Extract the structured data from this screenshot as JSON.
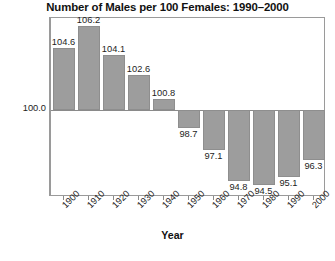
{
  "chart_data": {
    "type": "bar",
    "title": "Number of Males per 100 Females: 1990–2000",
    "xlabel": "Year",
    "ylabel": "",
    "categories": [
      "1900",
      "1910",
      "1920",
      "1930",
      "1940",
      "1950",
      "1960",
      "1970",
      "1980",
      "1990",
      "2000"
    ],
    "values": [
      104.6,
      106.2,
      104.1,
      102.6,
      100.8,
      98.7,
      97.1,
      94.8,
      94.5,
      95.1,
      96.3
    ],
    "value_labels": [
      "104.6",
      "106.2",
      "104.1",
      "102.6",
      "100.8",
      "98.7",
      "97.1",
      "94.8",
      "94.5",
      "95.1",
      "96.3"
    ],
    "baseline": 100.0,
    "baseline_label": "100.0",
    "y_tick_labels": [
      "100.0"
    ],
    "ylim": [
      93.6,
      106.8
    ],
    "grid": false,
    "legend": "none",
    "bar_color": "#9d9d9d",
    "bar_border_color": "#8e8e8e",
    "frame_color": "#9a9a9a",
    "text_color": "#1d1d1d",
    "tick_label_rotation": -45
  },
  "axes": {
    "x_title": "Year",
    "y_tick": "100.0"
  }
}
